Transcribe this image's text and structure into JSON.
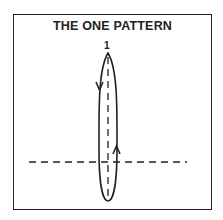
{
  "diagram": {
    "title": "THE ONE PATTERN",
    "label": "1",
    "elements": [
      {
        "type": "loop",
        "shape": "elongated-ellipse",
        "direction": "down-left-side, up-right-side"
      },
      {
        "type": "dashed-line",
        "orientation": "vertical",
        "through": "loop-center"
      },
      {
        "type": "dashed-line",
        "orientation": "horizontal"
      }
    ],
    "colors": {
      "stroke": "#222222",
      "background": "#ffffff"
    }
  }
}
